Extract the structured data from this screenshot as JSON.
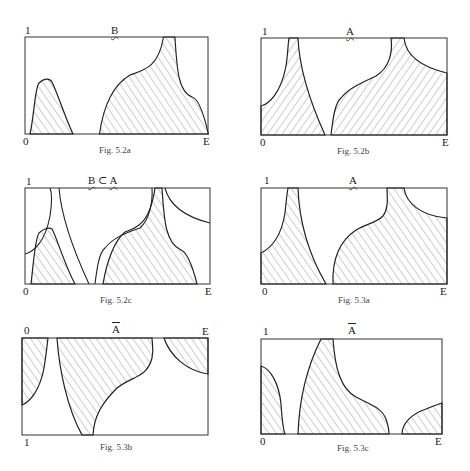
{
  "figures": [
    {
      "id": "fig-5-2a",
      "caption": "Fig. 5.2a",
      "set_label": "B",
      "label_style": "tilde",
      "y_top_label": "1",
      "origin_label": "0",
      "x_end_label": "E",
      "description": "Fuzzy set B membership: small hump near left, large shaded region on right"
    },
    {
      "id": "fig-5-2b",
      "caption": "Fig. 5.2b",
      "set_label": "A",
      "label_style": "tilde",
      "y_top_label": "1",
      "origin_label": "0",
      "x_end_label": "E",
      "description": "Fuzzy set A membership"
    },
    {
      "id": "fig-5-2c",
      "caption": "Fig. 5.2c",
      "set_label_left": "B",
      "set_label_op": "⊂",
      "set_label_right": "A",
      "label_style": "tilde",
      "y_top_label": "1",
      "origin_label": "0",
      "x_end_label": "E",
      "description": "B contained in A: B shaded, A outlined"
    },
    {
      "id": "fig-5-3a",
      "caption": "Fig. 5.3a",
      "set_label": "A",
      "label_style": "tilde",
      "y_top_label": "1",
      "origin_label": "0",
      "x_end_label": "E",
      "description": "Fuzzy set A membership"
    },
    {
      "id": "fig-5-3b",
      "caption": "Fig. 5.3b",
      "set_label": "A",
      "label_style": "bar",
      "y_top_label": "0",
      "origin_label": "1",
      "x_end_label": "E",
      "description": "Complement of A shown by inverting the axis (1 at bottom, 0 at top)"
    },
    {
      "id": "fig-5-3c",
      "caption": "Fig. 5.3c",
      "set_label": "A",
      "label_style": "bar",
      "y_top_label": "1",
      "origin_label": "0",
      "x_end_label": "E",
      "description": "Complement of A, membership 1 - μA(x)"
    }
  ]
}
